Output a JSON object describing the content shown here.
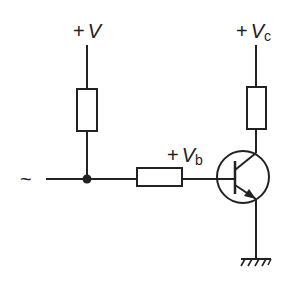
{
  "diagram": {
    "colors": {
      "stroke": "#222222",
      "background": "#ffffff"
    },
    "labels": {
      "supply_v": {
        "sign": "+",
        "symbol": "V",
        "subscript": ""
      },
      "supply_vc": {
        "sign": "+",
        "symbol": "V",
        "subscript": "c"
      },
      "base_vb": {
        "sign": "+",
        "symbol": "V",
        "subscript": "b"
      },
      "ac_source": "~"
    },
    "components": [
      {
        "id": "R1",
        "type": "resistor",
        "between": [
          "+V",
          "junction"
        ]
      },
      {
        "id": "R2",
        "type": "resistor",
        "between": [
          "+Vc",
          "collector"
        ]
      },
      {
        "id": "R3",
        "type": "resistor",
        "between": [
          "junction",
          "base"
        ]
      },
      {
        "id": "Q1",
        "type": "npn-transistor"
      },
      {
        "id": "GND",
        "type": "ground"
      },
      {
        "id": "IN",
        "type": "ac-input"
      }
    ]
  }
}
